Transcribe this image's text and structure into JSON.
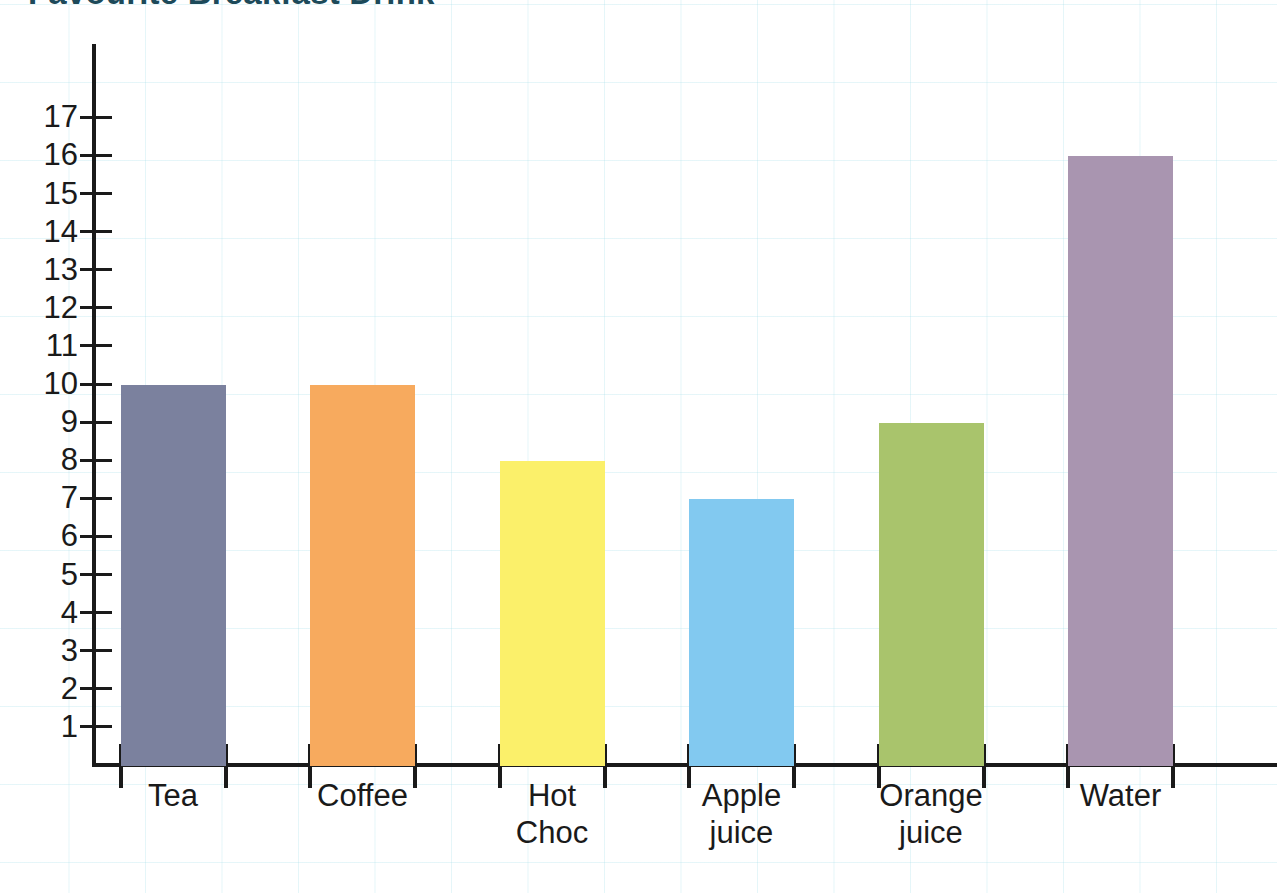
{
  "chart_data": {
    "type": "bar",
    "title": "Favourite Breakfast Drink",
    "xlabel": "",
    "ylabel": "",
    "categories": [
      "Tea",
      "Coffee",
      "Hot Choc",
      "Apple juice",
      "Orange juice",
      "Water"
    ],
    "values": [
      10,
      10,
      8,
      7,
      9,
      16
    ],
    "ylim": [
      0,
      17
    ],
    "ytick_labels": [
      "17",
      "16",
      "15",
      "14",
      "13",
      "12",
      "11",
      "10",
      "9",
      "8",
      "7",
      "6",
      "5",
      "4",
      "3",
      "2",
      "1"
    ],
    "ytick_values": [
      17,
      16,
      15,
      14,
      13,
      12,
      11,
      10,
      9,
      8,
      7,
      6,
      5,
      4,
      3,
      2,
      1
    ],
    "grid": true,
    "legend": "none",
    "bar_colors": [
      "#7b819e",
      "#f7aa5e",
      "#fbf06a",
      "#82c9f0",
      "#a9c46c",
      "#a995b0"
    ],
    "bars": [
      {
        "label": "Tea",
        "label_line1": "Tea",
        "label_line2": "",
        "value": 10,
        "color": "#7b819e"
      },
      {
        "label": "Coffee",
        "label_line1": "Coffee",
        "label_line2": "",
        "value": 10,
        "color": "#f7aa5e"
      },
      {
        "label": "Hot Choc",
        "label_line1": "Hot",
        "label_line2": "Choc",
        "value": 8,
        "color": "#fbf06a"
      },
      {
        "label": "Apple juice",
        "label_line1": "Apple",
        "label_line2": "juice",
        "value": 7,
        "color": "#82c9f0"
      },
      {
        "label": "Orange juice",
        "label_line1": "Orange",
        "label_line2": "juice",
        "value": 9,
        "color": "#a9c46c"
      },
      {
        "label": "Water",
        "label_line1": "Water",
        "label_line2": "",
        "value": 16,
        "color": "#a995b0"
      }
    ]
  },
  "colors": {
    "axis": "#1a1a1a",
    "title": "#1d4a5a",
    "grid": "#aae1eb",
    "background": "#ffffff"
  }
}
